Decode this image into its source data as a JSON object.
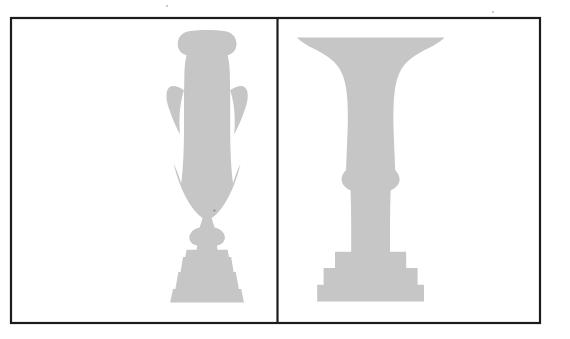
{
  "plate": {
    "title": "Two vase silhouettes",
    "background_color": "#ffffff",
    "width": 570,
    "height": 339
  },
  "frame": {
    "name": "outer-frame",
    "color": "#1c1c1c",
    "stroke_width": 2.2,
    "x": 11,
    "y": 18,
    "width": 529,
    "height": 305,
    "divider": {
      "name": "center-divider",
      "color": "#1c1c1c",
      "stroke_width": 2.2,
      "x": 277.5
    }
  },
  "panels": [
    {
      "id": "panel-left",
      "label": "Left panel",
      "figure": {
        "name": "winged-amphora-silhouette",
        "fill_color": "#c6c6c6",
        "description": "Tall amphora with flared rim, winged handles, knop and stepped rectangular pedestal base",
        "bbox": {
          "x": 166,
          "y": 30,
          "width": 82,
          "height": 273
        },
        "path": "M 190.5 31.0 C 183.0 32.0 178.5 36.0 177.8 42.5 C 177.2 48.5 180.2 53.5 186.5 55.2 C 185.2 61.0 184.6 67.0 184.4 73.0 L 184.1 90.5 C 181.0 88.0 177.6 86.3 174.0 86.0 C 170.6 85.7 168.2 87.4 167.2 90.6 C 165.8 95.2 166.5 101.0 168.6 107.5 C 171.4 116.4 175.6 126.0 180.0 134.5 C 178.9 122.0 179.4 110.0 181.6 99.5 C 182.4 95.6 183.2 92.6 184.0 90.4 L 184.0 131.5 C 183.9 150.0 183.2 168.0 181.2 183.5 C 179.0 176.0 176.4 169.0 173.6 163.5 C 176.4 175.5 180.6 187.5 186.0 197.5 C 189.5 204.0 193.3 209.5 197.2 213.6 C 199.0 215.5 200.8 217.0 202.6 218.0 C 201.6 221.5 200.6 224.8 199.6 227.6 C 196.0 228.4 193.2 230.0 191.4 232.2 C 189.4 234.7 188.8 237.6 189.8 240.2 C 190.8 242.9 193.4 244.8 197.2 245.6 C 197.0 247.2 196.8 248.6 196.6 249.8 L 186.6 249.8 L 185.2 257.0 L 183.0 257.0 L 180.6 272.0 L 178.4 272.0 L 175.4 289.0 L 173.0 289.0 L 170.2 302.6 L 244.0 302.6 L 241.2 289.0 L 238.8 289.0 L 235.8 272.0 L 233.6 272.0 L 231.2 257.0 L 229.0 257.0 L 227.6 249.8 L 217.6 249.8 C 217.4 248.6 217.2 247.2 217.0 245.6 C 220.8 244.8 223.4 242.9 224.4 240.2 C 225.4 237.6 224.8 234.7 222.8 232.2 C 221.0 230.0 218.2 228.4 214.6 227.6 C 213.6 224.8 212.6 221.5 211.6 218.0 C 213.4 217.0 215.2 215.5 217.0 213.6 C 220.9 209.5 224.7 204.0 228.2 197.5 C 233.6 187.5 237.8 175.5 240.6 163.5 C 237.8 169.0 235.2 176.0 233.0 183.5 C 231.0 168.0 230.3 150.0 230.2 131.5 L 230.2 90.4 C 231.0 92.6 231.8 95.6 232.6 99.5 C 234.8 110.0 235.3 122.0 234.2 134.5 C 238.6 126.0 242.8 116.4 245.6 107.5 C 247.7 101.0 248.4 95.2 247.0 90.6 C 246.0 87.4 243.6 85.7 240.2 86.0 C 236.6 86.3 233.2 88.0 230.1 90.5 L 229.8 73.0 C 229.6 67.0 229.0 61.0 227.7 55.2 C 234.0 53.5 237.0 48.5 236.4 42.5 C 235.7 36.0 231.2 32.0 223.7 31.0 C 218.6 30.3 212.0 30.0 207.1 30.0 C 202.2 30.0 195.6 30.3 190.5 31.0 Z"
      }
    },
    {
      "id": "panel-right",
      "label": "Right panel",
      "figure": {
        "name": "flared-beaker-vase-silhouette",
        "fill_color": "#c6c6c6",
        "description": "Wide trumpet-mouth beaker vase with pinched waist and stepped plinth base",
        "bbox": {
          "x": 296,
          "y": 37,
          "width": 150,
          "height": 265
        },
        "path": "M 297.0 37.5 L 444.6 37.5 C 440.0 42.0 434.0 45.6 427.8 48.6 C 418.0 53.4 409.2 58.6 403.6 66.0 C 398.0 73.4 395.6 82.8 394.4 93.8 C 393.2 104.8 393.2 117.2 393.6 130.0 C 393.9 139.4 394.3 148.0 394.6 155.6 C 394.8 161.2 395.0 166.0 395.2 170.0 C 397.2 172.2 398.8 174.6 399.4 177.4 C 400.0 180.2 399.4 183.0 397.4 185.4 C 395.6 187.6 393.0 189.2 390.6 190.6 C 390.2 203.5 390.0 216.5 390.0 229.0 L 390.0 251.8 L 406.2 251.8 L 406.2 268.0 L 417.6 268.0 L 417.6 284.8 L 424.0 284.8 L 424.0 301.6 L 317.2 301.6 L 317.2 284.8 L 323.6 284.8 L 323.6 268.0 L 335.0 268.0 L 335.0 251.8 L 351.2 251.8 L 351.2 229.0 C 351.2 216.5 351.0 203.5 350.6 190.6 C 348.2 189.2 345.6 187.6 343.8 185.4 C 341.8 183.0 341.2 180.2 341.8 177.4 C 342.4 174.6 344.0 172.2 346.0 170.0 C 346.2 166.0 346.4 161.2 346.6 155.6 C 346.9 148.0 347.3 139.4 347.6 130.0 C 348.0 117.2 348.0 104.8 346.8 93.8 C 345.6 82.8 343.2 73.4 337.6 66.0 C 332.0 58.6 323.2 53.4 313.4 48.6 C 307.2 45.6 301.2 42.0 297.0 37.5 Z"
      }
    }
  ],
  "marks": [
    {
      "name": "speck-mark-left-panel",
      "color": "#8a8a8a",
      "x": 214.5,
      "y": 210.5,
      "radius": 1.1
    },
    {
      "name": "speck-mark-top-edge",
      "color": "#b9b9b9",
      "x": 167.0,
      "y": 6.0,
      "radius": 1.0
    },
    {
      "name": "speck-mark-top-right",
      "color": "#b9b9b9",
      "x": 493.0,
      "y": 12.0,
      "radius": 1.0
    }
  ]
}
